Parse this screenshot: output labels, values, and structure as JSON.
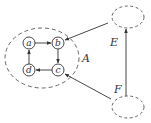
{
  "diagram": {
    "groups": [
      {
        "id": "A",
        "label": "A"
      },
      {
        "id": "E",
        "label": "E"
      },
      {
        "id": "F",
        "label": "F"
      }
    ],
    "nodes": [
      {
        "id": "a",
        "label": "a"
      },
      {
        "id": "b",
        "label": "b"
      },
      {
        "id": "c",
        "label": "c"
      },
      {
        "id": "d",
        "label": "d"
      }
    ],
    "edges": [
      {
        "from": "a",
        "to": "b"
      },
      {
        "from": "b",
        "to": "c"
      },
      {
        "from": "c",
        "to": "d"
      },
      {
        "from": "d",
        "to": "a"
      },
      {
        "from": "E",
        "to": "b"
      },
      {
        "from": "F",
        "to": "c"
      },
      {
        "from": "F",
        "to": "E"
      }
    ],
    "colors": {
      "stroke": "#333333",
      "background": "#ffffff"
    }
  }
}
